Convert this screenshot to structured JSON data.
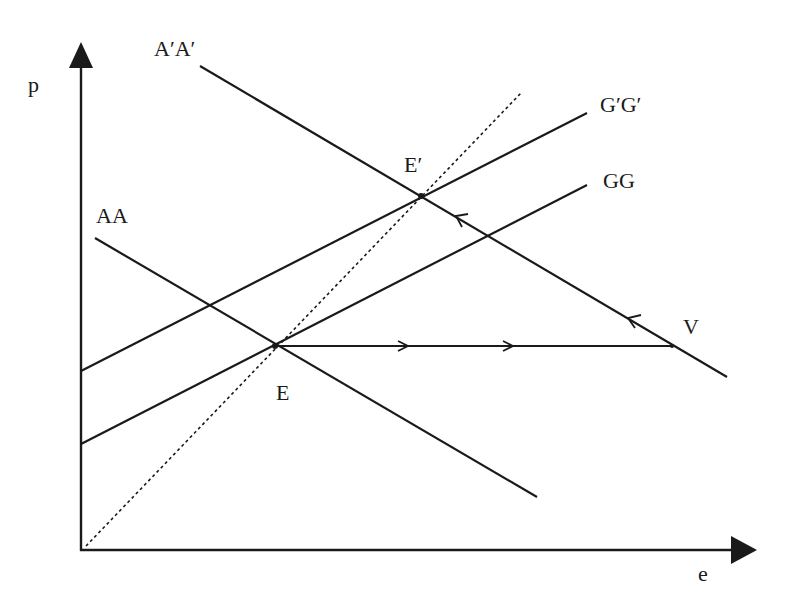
{
  "diagram": {
    "type": "economics-dd-aa-diagram",
    "axes": {
      "y_label": "p",
      "x_label": "e"
    },
    "curves": {
      "aa": {
        "label": "AA"
      },
      "a_prime_a_prime": {
        "label": "A′A′"
      },
      "gg": {
        "label": "GG"
      },
      "g_prime_g_prime": {
        "label": "G′G′"
      },
      "forty_five_line": {
        "label": ""
      }
    },
    "points": {
      "e": {
        "label": "E"
      },
      "e_prime": {
        "label": "E′"
      },
      "v": {
        "label": "V"
      }
    },
    "colors": {
      "ink": "#1a1a1a",
      "background": "#ffffff"
    }
  }
}
